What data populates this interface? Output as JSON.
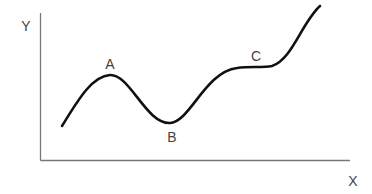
{
  "diagram": {
    "type": "curve-on-axes",
    "axes": {
      "x_label": "X",
      "y_label": "Y",
      "axis_color": "#777777"
    },
    "curve": {
      "color": "#111111",
      "points": [
        {
          "id": "A",
          "label": "A",
          "kind": "local-maximum"
        },
        {
          "id": "B",
          "label": "B",
          "kind": "local-minimum"
        },
        {
          "id": "C",
          "label": "C",
          "kind": "inflection-plateau"
        }
      ]
    }
  }
}
